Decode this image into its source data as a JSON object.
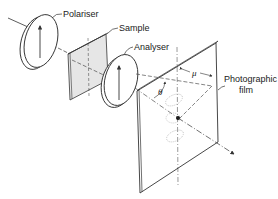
{
  "figure": {
    "type": "schematic",
    "labels": {
      "polariser": "Polariser",
      "sample": "Sample",
      "analyser": "Analyser",
      "film_line1": "Photographic",
      "film_line2": "film"
    },
    "symbols": {
      "azimuth": "μ",
      "scatter_angle": "θ"
    },
    "colors": {
      "line": "#333333",
      "sample_fill": "#e6e6e6",
      "background": "#ffffff"
    }
  }
}
